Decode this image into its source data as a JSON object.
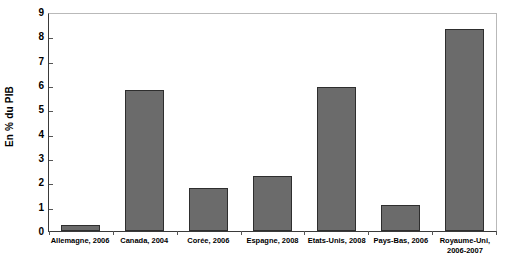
{
  "chart_data": {
    "type": "bar",
    "title": "",
    "xlabel": "",
    "ylabel": "En % du PIB",
    "ylim": [
      0,
      9
    ],
    "ytick_labels": [
      "9",
      "8",
      "7",
      "6",
      "5",
      "4",
      "3",
      "2",
      "1",
      "0"
    ],
    "yticks": [
      9,
      8,
      7,
      6,
      5,
      4,
      3,
      2,
      1,
      0
    ],
    "grid": false,
    "legend": "none",
    "categories": [
      "Allemagne, 2006",
      "Canada, 2004",
      "Corée, 2006",
      "Espagne, 2008",
      "Etats-Unis, 2008",
      "Pays-Bas, 2006",
      "Royaume-Uni, 2006-2007"
    ],
    "values": [
      0.25,
      5.8,
      1.75,
      2.25,
      5.9,
      1.05,
      8.3
    ],
    "bar_color": "#6b6b6b",
    "bar_border_color": "#2e2e2e",
    "axis_color": "#3a3a3a",
    "frame_color": "#b9b9b9",
    "background": "#ffffff"
  }
}
